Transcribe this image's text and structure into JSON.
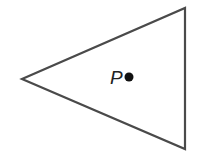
{
  "diagram": {
    "type": "geometry",
    "shape": "triangle",
    "vertices": [
      {
        "x": 22,
        "y": 79
      },
      {
        "x": 185,
        "y": 8
      },
      {
        "x": 185,
        "y": 149
      }
    ],
    "stroke_color": "#4a4a4a",
    "fill_color": "#ffffff",
    "point": {
      "label": "P",
      "x": 129,
      "y": 77,
      "color": "#111111"
    }
  }
}
